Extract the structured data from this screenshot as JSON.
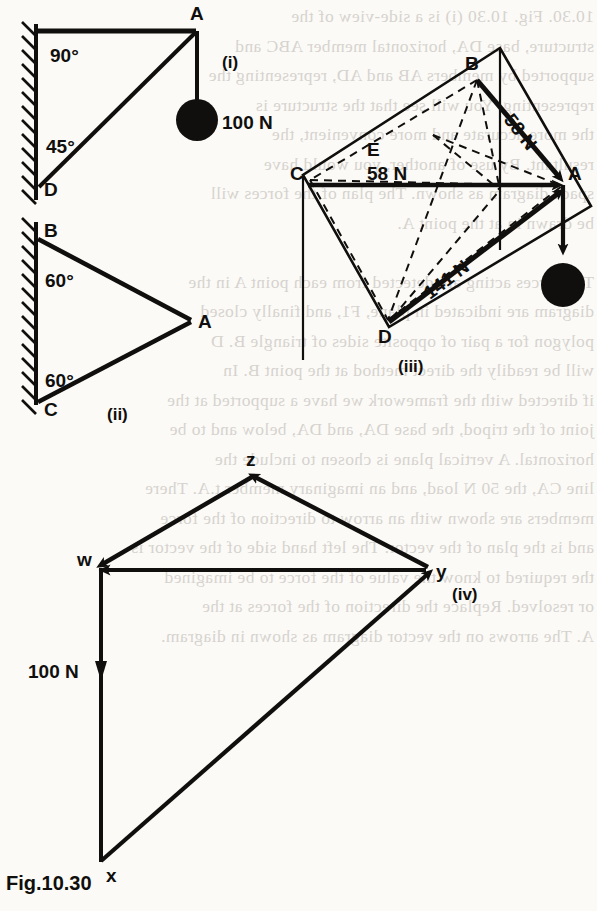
{
  "figure": {
    "caption": "Fig.10.30",
    "panels": [
      {
        "id": "i",
        "label": "(i)",
        "points": [
          "A",
          "D"
        ],
        "angles": [
          "90°",
          "45°"
        ],
        "forces": [
          "100 N"
        ]
      },
      {
        "id": "ii",
        "label": "(ii)",
        "points": [
          "B",
          "A",
          "C"
        ],
        "angles": [
          "60°",
          "60°"
        ],
        "forces": []
      },
      {
        "id": "iii",
        "label": "(iii)",
        "points": [
          "B",
          "E",
          "C",
          "A",
          "D"
        ],
        "angles": [],
        "forces": [
          "58 N",
          "58 N",
          "141 N"
        ]
      },
      {
        "id": "iv",
        "label": "(iv)",
        "points": [
          "z",
          "w",
          "y",
          "x"
        ],
        "angles": [],
        "forces": [
          "100 N"
        ]
      }
    ]
  },
  "labels": {
    "A1": "A",
    "D1": "D",
    "ang90": "90°",
    "ang45": "45°",
    "load100_i": "100 N",
    "panel_i": "(i)",
    "B2": "B",
    "A2": "A",
    "C2": "C",
    "ang60_top": "60°",
    "ang60_bot": "60°",
    "panel_ii": "(ii)",
    "B3": "B",
    "E3": "E",
    "C3": "C",
    "A3": "A",
    "D3": "D",
    "f58_ba": "58 N",
    "f58_ca": "58 N",
    "f141_da": "141 N",
    "panel_iii": "(iii)",
    "z4": "z",
    "w4": "w",
    "y4": "y",
    "x4": "x",
    "load100_iv": "100 N",
    "panel_iv": "(iv)",
    "caption": "Fig.10.30"
  },
  "ghost_text": {
    "lines": [
      "10.30. Fig. 10.30 (i) is a side-view of the",
      "structure, base DA, horizontal member ABC and",
      "supported by members AB and AD, representing the",
      "representing. You will see that the structure is",
      "the more accurate and more convenient, the",
      "resultant. By use of another, you would have",
      "space diagram as shown. The plan of the forces will",
      "be drawn in at the point A.",
      "",
      "The forces acting are detected from each point A in the",
      "diagram are indicated in plane, F1, and finally closed",
      "polygon for a pair of opposite sides of triangle B. D",
      "will be readily the direct method at the point B. In",
      "if directed with the framework we have a supported at the",
      "joint of the tripod, the base DA, and DA, below and to be",
      "horizontal. A vertical plane is chosen to include the",
      "line CA, the 50 N load, and an imaginary member t.A. There",
      "members are shown with an arrow to direction of the force",
      "and is the plan of the vector. The left hand side of the vector is",
      "the required to know the value of the force to be imagined",
      "or resolved. Replace the direction of the forces at the",
      "A. The arrows on the vector diagram as shown in diagram."
    ]
  },
  "colors": {
    "ink": "#100f0d",
    "paper": "#fbfaf7",
    "ghost": "#b9b4ad"
  }
}
